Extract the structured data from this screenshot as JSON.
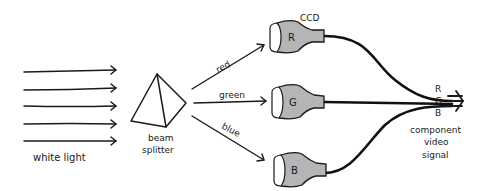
{
  "diagram": {
    "input": {
      "label": "white light",
      "arrow_count": 5
    },
    "splitter": {
      "label_line1": "beam",
      "label_line2": "splitter"
    },
    "beams": [
      {
        "label": "red",
        "color": "red"
      },
      {
        "label": "green",
        "color": "green"
      },
      {
        "label": "blue",
        "color": "blue"
      }
    ],
    "sensors": {
      "label": "CCD",
      "items": [
        {
          "letter": "R"
        },
        {
          "letter": "G"
        },
        {
          "letter": "B"
        }
      ]
    },
    "output": {
      "channels": [
        "R",
        "G",
        "B"
      ],
      "label_line1": "component",
      "label_line2": "video",
      "label_line3": "signal"
    },
    "colors": {
      "ink": "#1a1a1a",
      "ccd_fill": "#b5b5b5",
      "background": "#ffffff"
    }
  }
}
